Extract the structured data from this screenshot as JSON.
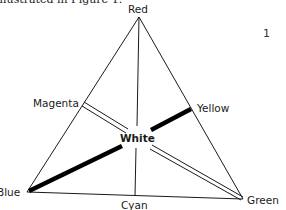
{
  "caption": {
    "text": "illustrated in Figure 1."
  },
  "page_number": "1",
  "diagram": {
    "type": "color-triangle",
    "vertices": {
      "top": "Red",
      "bottom_left": "Blue",
      "bottom_right": "Green"
    },
    "edge_midpoints": {
      "left": "Magenta",
      "right": "Yellow",
      "bottom": "Cyan"
    },
    "center": "White",
    "connections": [
      {
        "from": "Red",
        "to": "White",
        "style": "thin"
      },
      {
        "from": "White",
        "to": "Cyan",
        "style": "thin"
      },
      {
        "from": "Yellow",
        "to": "White",
        "style": "thick"
      },
      {
        "from": "White",
        "to": "Blue",
        "style": "thick"
      },
      {
        "from": "Magenta",
        "to": "White",
        "style": "double"
      },
      {
        "from": "White",
        "to": "Green",
        "style": "double"
      }
    ]
  },
  "labels": {
    "red": "Red",
    "blue": "Blue",
    "green": "Green",
    "magenta": "Magenta",
    "yellow": "Yellow",
    "cyan": "Cyan",
    "white": "White"
  }
}
